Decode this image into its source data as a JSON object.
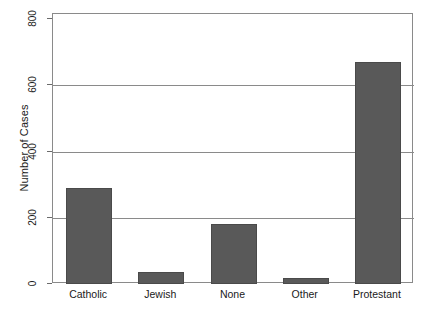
{
  "chart_data": {
    "type": "bar",
    "title": "",
    "xlabel": "",
    "ylabel": "Number of Cases",
    "categories": [
      "Catholic",
      "Jewish",
      "None",
      "Other",
      "Protestant"
    ],
    "values": [
      290,
      35,
      180,
      18,
      670
    ],
    "ylim": [
      0,
      800
    ],
    "yticks": [
      0,
      200,
      400,
      600,
      800
    ],
    "ytick_labels": [
      "0",
      "200",
      "400",
      "600",
      "800"
    ],
    "grid": "horizontal",
    "legend": "none",
    "bar_color": "#595959",
    "axis_color": "#8a8a8a",
    "text_color": "#1a1a1a"
  }
}
